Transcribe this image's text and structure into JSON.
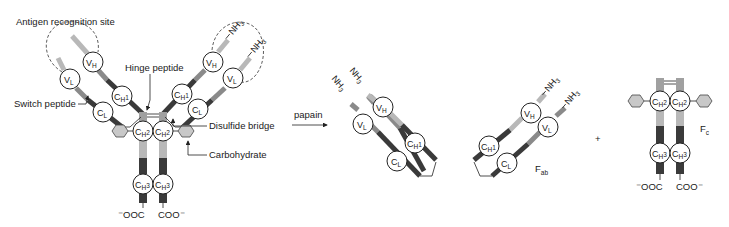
{
  "diagram": {
    "type": "antibody papain digestion",
    "colors": {
      "variable": "#b8b8b8",
      "switch": "#8a8a8a",
      "constant": "#3a3a3a",
      "hinge": "#a0a0a0",
      "carbohydrate": "#c8c8c8"
    },
    "labels": {
      "antigen_site": "Antigen recognition site",
      "hinge": "Hinge peptide",
      "switch": "Switch peptide",
      "disulfide": "Disulfide bridge",
      "carbohydrate": "Carbohydrate",
      "papain": "papain",
      "plus": "+",
      "fab": "F",
      "fab_sub": "ab",
      "fc": "F",
      "fc_sub": "c"
    },
    "termini": {
      "n": "NH",
      "n_sub": "3",
      "plus": "+",
      "c_left": "⁻OOC",
      "c_right": "COO⁻"
    },
    "domains": {
      "vh": "V",
      "vh_sub": "H",
      "vl": "V",
      "vl_sub": "L",
      "ch1": "C",
      "ch1_sub": "H",
      "ch1_n": "1",
      "cl": "C",
      "cl_sub": "L",
      "ch2": "C",
      "ch2_sub": "H",
      "ch2_n": "2",
      "ch3": "C",
      "ch3_sub": "H",
      "ch3_n": "3"
    }
  }
}
